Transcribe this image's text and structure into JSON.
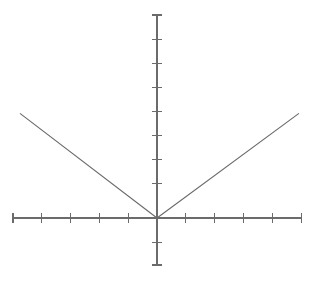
{
  "figure": {
    "title": "",
    "background_color": "#ffffff",
    "ink_color": "#6b6b6b",
    "width": 319,
    "height": 289
  },
  "chart_data": {
    "type": "line",
    "title": "",
    "subtitle": "",
    "xlabel": "",
    "ylabel": "",
    "function_label": "y = |x|",
    "grid": false,
    "legend": false,
    "legend_position": "none",
    "axis_style": "centered-crosshair",
    "xlim": [
      -5,
      5
    ],
    "ylim": [
      -2,
      8.4
    ],
    "xticks": [
      -5,
      -4,
      -3,
      -2,
      -1,
      0,
      1,
      2,
      3,
      4,
      5
    ],
    "yticks": [
      -2,
      -1,
      0,
      1,
      2,
      3,
      4,
      5,
      6,
      7,
      8
    ],
    "xticklabels": [
      "",
      "",
      "",
      "",
      "",
      "",
      "",
      "",
      "",
      "",
      ""
    ],
    "yticklabels": [
      "",
      "",
      "",
      "",
      "",
      "",
      "",
      "",
      "",
      "",
      ""
    ],
    "series": [
      {
        "name": "y = |x|",
        "color": "#6b6b6b",
        "x": [
          -4.75,
          0,
          4.92
        ],
        "y": [
          4.34,
          0,
          4.34
        ]
      }
    ],
    "annotations": []
  },
  "geometry": {
    "origin_x": 157,
    "origin_y": 218,
    "x_axis_start": 13,
    "x_axis_end": 302,
    "y_axis_top": 15,
    "y_axis_bottom": 265,
    "x_tick_spacing": 28.9,
    "y_tick_spacing": 24.1,
    "x_tick_half_length": 5,
    "y_tick_half_length": 5,
    "vertex": {
      "x": 157,
      "y": 218
    },
    "left_end": {
      "x": 20,
      "y": 92
    },
    "right_end": {
      "x": 299,
      "y": 92
    },
    "x_tick_positions": [
      13,
      41.9,
      70.8,
      99.7,
      128.6,
      157,
      185.9,
      214.8,
      243.7,
      272.6,
      301.5
    ],
    "y_tick_positions": [
      15,
      39.1,
      63.2,
      87.3,
      111.4,
      135.5,
      159.6,
      183.7,
      193.9,
      218,
      242.1,
      265
    ]
  }
}
